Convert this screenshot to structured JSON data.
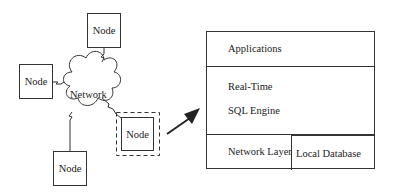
{
  "network": {
    "cloud_label": "Network",
    "nodes": [
      {
        "id": "top",
        "label": "Node"
      },
      {
        "id": "left",
        "label": "Node"
      },
      {
        "id": "bottom",
        "label": "Node"
      },
      {
        "id": "highlighted",
        "label": "Node",
        "highlighted": true
      }
    ]
  },
  "node_architecture": {
    "layers": [
      {
        "label": "Applications"
      },
      {
        "label": "Real-Time",
        "sublabel": "SQL Engine"
      },
      {
        "label": "Local Database"
      },
      {
        "label": "Network Layer"
      }
    ]
  },
  "arrow": {
    "from": "highlighted-node",
    "to": "node-architecture"
  }
}
